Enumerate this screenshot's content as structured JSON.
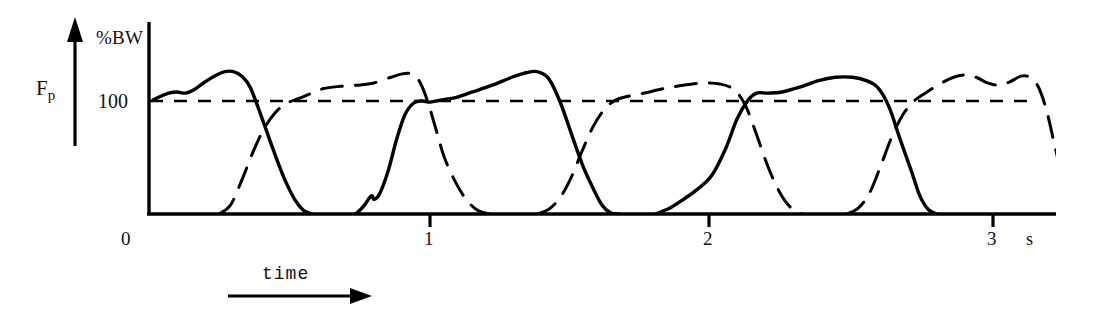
{
  "figure": {
    "axis": {
      "y_label": "%BW",
      "y_tick_label": "100",
      "y_axis_name": "F",
      "y_axis_subscript": "p",
      "x_axis_label": "time",
      "x_unit": "s",
      "x_tick_labels": [
        "0",
        "1",
        "2",
        "3"
      ],
      "x_tick_values": [
        0,
        1,
        2,
        3
      ],
      "reference_line_value": 100
    },
    "colors": {
      "ink": "#000000",
      "background": "#ffffff"
    }
  },
  "chart_data": {
    "type": "line",
    "title": "",
    "subtitle": "",
    "xlabel": "time",
    "ylabel": "F_p (%BW)",
    "xunit": "s",
    "xlim": [
      0,
      3.22
    ],
    "ylim": [
      0,
      160
    ],
    "grid": false,
    "legend": "none",
    "annotations": [
      {
        "text": "%BW",
        "role": "y-axis-unit"
      },
      {
        "text": "100",
        "role": "y-tick"
      },
      {
        "text": "F_p",
        "role": "y-axis-quantity"
      },
      {
        "text": "time",
        "role": "x-axis-arrow-label"
      },
      {
        "text": "s",
        "role": "x-axis-unit"
      }
    ],
    "reference_lines": [
      {
        "axis": "y",
        "value": 100,
        "style": "dashed",
        "label": "100"
      }
    ],
    "series": [
      {
        "name": "right-foot-vertical-force",
        "style": "solid",
        "color": "#000000",
        "points": [
          [
            0.015,
            101
          ],
          [
            0.04,
            104
          ],
          [
            0.07,
            107
          ],
          [
            0.1,
            108
          ],
          [
            0.13,
            107
          ],
          [
            0.16,
            110
          ],
          [
            0.2,
            117
          ],
          [
            0.24,
            123
          ],
          [
            0.27,
            126
          ],
          [
            0.3,
            126
          ],
          [
            0.33,
            122
          ],
          [
            0.36,
            112
          ],
          [
            0.4,
            86
          ],
          [
            0.44,
            58
          ],
          [
            0.48,
            32
          ],
          [
            0.52,
            12
          ],
          [
            0.55,
            3
          ],
          [
            0.58,
            0
          ],
          [
            0.735,
            0
          ],
          [
            0.76,
            6
          ],
          [
            0.79,
            16
          ],
          [
            0.8,
            13
          ],
          [
            0.82,
            18
          ],
          [
            0.85,
            38
          ],
          [
            0.88,
            66
          ],
          [
            0.91,
            88
          ],
          [
            0.94,
            98
          ],
          [
            0.97,
            100
          ],
          [
            1.0,
            99
          ],
          [
            1.04,
            101
          ],
          [
            1.09,
            103
          ],
          [
            1.15,
            108
          ],
          [
            1.22,
            114
          ],
          [
            1.29,
            121
          ],
          [
            1.34,
            125
          ],
          [
            1.38,
            126
          ],
          [
            1.42,
            120
          ],
          [
            1.46,
            100
          ],
          [
            1.5,
            72
          ],
          [
            1.54,
            44
          ],
          [
            1.58,
            22
          ],
          [
            1.61,
            8
          ],
          [
            1.64,
            1
          ],
          [
            1.67,
            0
          ],
          [
            1.8,
            0
          ],
          [
            1.85,
            5
          ],
          [
            1.9,
            13
          ],
          [
            1.95,
            22
          ],
          [
            2.0,
            34
          ],
          [
            2.05,
            58
          ],
          [
            2.09,
            84
          ],
          [
            2.13,
            101
          ],
          [
            2.16,
            107
          ],
          [
            2.2,
            107
          ],
          [
            2.25,
            108
          ],
          [
            2.31,
            112
          ],
          [
            2.38,
            118
          ],
          [
            2.44,
            121
          ],
          [
            2.5,
            121
          ],
          [
            2.55,
            118
          ],
          [
            2.59,
            112
          ],
          [
            2.63,
            95
          ],
          [
            2.67,
            66
          ],
          [
            2.71,
            38
          ],
          [
            2.74,
            16
          ],
          [
            2.77,
            4
          ],
          [
            2.8,
            0
          ],
          [
            3.18,
            0
          ]
        ]
      },
      {
        "name": "left-foot-vertical-force",
        "style": "dashed",
        "color": "#000000",
        "points": [
          [
            0.02,
            0
          ],
          [
            0.25,
            0
          ],
          [
            0.29,
            8
          ],
          [
            0.33,
            30
          ],
          [
            0.37,
            55
          ],
          [
            0.41,
            76
          ],
          [
            0.45,
            90
          ],
          [
            0.49,
            98
          ],
          [
            0.53,
            102
          ],
          [
            0.57,
            106
          ],
          [
            0.62,
            111
          ],
          [
            0.68,
            113
          ],
          [
            0.74,
            114
          ],
          [
            0.8,
            116
          ],
          [
            0.86,
            121
          ],
          [
            0.9,
            124
          ],
          [
            0.93,
            124
          ],
          [
            0.96,
            118
          ],
          [
            0.99,
            100
          ],
          [
            1.02,
            75
          ],
          [
            1.05,
            50
          ],
          [
            1.09,
            28
          ],
          [
            1.13,
            12
          ],
          [
            1.17,
            3
          ],
          [
            1.21,
            0
          ],
          [
            1.38,
            0
          ],
          [
            1.42,
            4
          ],
          [
            1.46,
            14
          ],
          [
            1.5,
            32
          ],
          [
            1.54,
            56
          ],
          [
            1.58,
            78
          ],
          [
            1.62,
            93
          ],
          [
            1.66,
            101
          ],
          [
            1.7,
            104
          ],
          [
            1.76,
            107
          ],
          [
            1.83,
            111
          ],
          [
            1.9,
            114
          ],
          [
            1.97,
            116
          ],
          [
            2.03,
            115
          ],
          [
            2.08,
            110
          ],
          [
            2.12,
            96
          ],
          [
            2.16,
            70
          ],
          [
            2.2,
            42
          ],
          [
            2.24,
            20
          ],
          [
            2.28,
            6
          ],
          [
            2.32,
            0
          ],
          [
            2.48,
            0
          ],
          [
            2.52,
            5
          ],
          [
            2.56,
            18
          ],
          [
            2.6,
            42
          ],
          [
            2.64,
            68
          ],
          [
            2.68,
            88
          ],
          [
            2.72,
            100
          ],
          [
            2.76,
            107
          ],
          [
            2.81,
            115
          ],
          [
            2.86,
            121
          ],
          [
            2.9,
            123
          ],
          [
            2.94,
            121
          ],
          [
            2.98,
            116
          ],
          [
            3.02,
            114
          ],
          [
            3.06,
            117
          ],
          [
            3.1,
            122
          ],
          [
            3.13,
            121
          ],
          [
            3.16,
            113
          ],
          [
            3.19,
            92
          ],
          [
            3.22,
            60
          ],
          [
            3.25,
            30
          ],
          [
            3.28,
            10
          ],
          [
            3.31,
            1
          ],
          [
            3.33,
            0
          ]
        ]
      }
    ]
  }
}
